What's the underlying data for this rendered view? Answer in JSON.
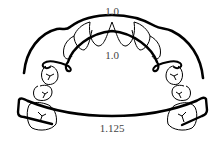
{
  "diagram": {
    "labels": {
      "outer_wire": "1.0",
      "inner_wire": "1.0",
      "lower_wire": "1.125"
    },
    "colors": {
      "stroke": "#000000",
      "label": "#444444",
      "background": "#ffffff"
    }
  }
}
